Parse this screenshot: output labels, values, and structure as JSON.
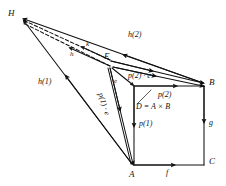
{
  "figure": {
    "type": "geometric-diagram",
    "background_color": "#ffffff",
    "stroke_color": "#111111"
  },
  "vertices": [
    {
      "id": "H",
      "label": "H",
      "x": 22,
      "y": 16,
      "label_x": 8,
      "label_y": 9
    },
    {
      "id": "E",
      "label": "E",
      "x": 111,
      "y": 64,
      "label_x": 104,
      "label_y": 53
    },
    {
      "id": "B",
      "label": "B",
      "x": 204,
      "y": 86,
      "label_x": 209,
      "label_y": 79
    },
    {
      "id": "C",
      "label": "C",
      "x": 204,
      "y": 164,
      "label_x": 209,
      "label_y": 158
    },
    {
      "id": "A",
      "label": "A",
      "x": 134,
      "y": 165,
      "label_x": 129,
      "label_y": 171
    },
    {
      "id": "D",
      "label": "D",
      "x": 134,
      "y": 86,
      "label_x": 0,
      "label_y": 0
    }
  ],
  "edge_labels": [
    {
      "name": "h-2",
      "text": "h(2)",
      "x": 128,
      "y": 33
    },
    {
      "name": "h-1",
      "text": "h(1)",
      "x": 38,
      "y": 80
    },
    {
      "name": "k",
      "text": "k",
      "x": 85,
      "y": 44
    },
    {
      "name": "h",
      "text": "h",
      "x": 70,
      "y": 54
    },
    {
      "name": "e",
      "text": "e",
      "x": 114,
      "y": 80
    },
    {
      "name": "p2-dot-e",
      "text": "p(2) · e",
      "x": 130,
      "y": 76
    },
    {
      "name": "p1-dot-e",
      "text": "p(1) · e",
      "x": 103,
      "y": 96
    },
    {
      "name": "p2",
      "text": "p(2)",
      "x": 158,
      "y": 95
    },
    {
      "name": "p1",
      "text": "p(1)",
      "x": 140,
      "y": 123
    },
    {
      "name": "f",
      "text": "f",
      "x": 166,
      "y": 171
    },
    {
      "name": "g",
      "text": "g",
      "x": 209,
      "y": 122
    }
  ],
  "annotations": [
    {
      "name": "product-equation",
      "text": "D = A × B",
      "x": 137,
      "y": 106
    }
  ]
}
